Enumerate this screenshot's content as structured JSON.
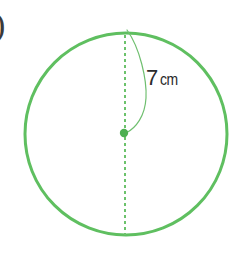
{
  "figure": {
    "type": "geometry-diagram",
    "shape": "circle",
    "background_color": "#ffffff",
    "item_marker": ")",
    "radius_label": {
      "value": "7",
      "unit": "cm",
      "full": "7 cm",
      "text_color": "#2b2b2b"
    },
    "colors": {
      "outline_green": "#5fbf60",
      "dashed_green": "#6cc26c",
      "center_dot_green": "#4caf50",
      "leader_green": "#6fbf6f"
    },
    "geometry": {
      "center_x": 126,
      "center_y": 134,
      "radius_px": 101,
      "outline_stroke_width": 3,
      "dashed_line_x": 125,
      "dashed_stroke_width": 2,
      "dash_pattern": "3 3",
      "center_dot_x": 124,
      "center_dot_y": 133,
      "center_dot_radius": 4.2,
      "leader_stroke_width": 1.2
    },
    "annotations": {
      "diameter_line": "dashed vertical diameter",
      "radius_leader": "curved leader from top of circle to center"
    }
  }
}
